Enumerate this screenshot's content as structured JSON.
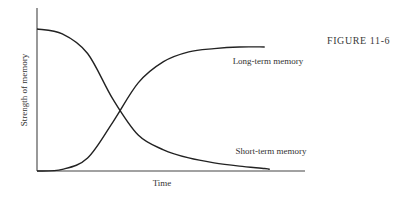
{
  "figure_label": "FIGURE 11-6",
  "chart_data": {
    "type": "line",
    "title": "",
    "xlabel": "Time",
    "ylabel": "Strength of memory",
    "xlim": [
      0,
      100
    ],
    "ylim": [
      0,
      100
    ],
    "grid": false,
    "legend": "inline labels at right end of each curve",
    "x_ticks": [],
    "y_ticks": [],
    "series": [
      {
        "name": "Short-term memory",
        "label": "Short-term memory",
        "x": [
          0,
          10,
          20,
          30,
          40,
          50,
          60,
          70,
          80,
          90,
          92
        ],
        "y": [
          87,
          84,
          72,
          44,
          22,
          13,
          8,
          5,
          3,
          1.5,
          1
        ]
      },
      {
        "name": "Long-term memory",
        "label": "Long-term memory",
        "x": [
          0,
          10,
          20,
          30,
          40,
          50,
          60,
          70,
          80,
          90
        ],
        "y": [
          0,
          1,
          8,
          30,
          54,
          67,
          73,
          75,
          76,
          76
        ]
      }
    ]
  }
}
